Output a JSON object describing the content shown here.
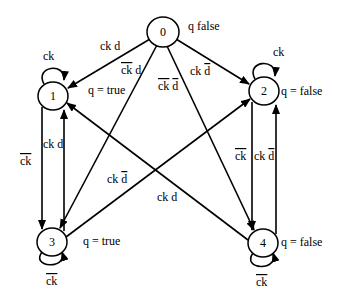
{
  "diagram": {
    "type": "state-machine",
    "nodes": [
      {
        "id": "0",
        "label": "0",
        "output": "q false",
        "cx": 163,
        "cy": 32
      },
      {
        "id": "1",
        "label": "1",
        "output": "q = true",
        "cx": 53,
        "cy": 96
      },
      {
        "id": "2",
        "label": "2",
        "output": "q = false",
        "cx": 264,
        "cy": 91
      },
      {
        "id": "3",
        "label": "3",
        "output": "q = true",
        "cx": 52,
        "cy": 242
      },
      {
        "id": "4",
        "label": "4",
        "output": "q = false",
        "cx": 263,
        "cy": 243
      }
    ],
    "edges": [
      {
        "from": "0",
        "to": "1",
        "label": "ck d"
      },
      {
        "from": "0",
        "to": "3",
        "label": "ck̄ d"
      },
      {
        "from": "0",
        "to": "4",
        "label": "ck̄ d̄"
      },
      {
        "from": "0",
        "to": "2",
        "label": "ck d̄"
      },
      {
        "from": "1",
        "to": "1",
        "label": "ck"
      },
      {
        "from": "1",
        "to": "3",
        "label": "ck̄"
      },
      {
        "from": "3",
        "to": "1",
        "label": "ck d"
      },
      {
        "from": "3",
        "to": "2",
        "label": "ck d̄"
      },
      {
        "from": "4",
        "to": "1",
        "label": "ck d"
      },
      {
        "from": "2",
        "to": "2",
        "label": "ck"
      },
      {
        "from": "2",
        "to": "4",
        "label": "ck̄"
      },
      {
        "from": "4",
        "to": "2",
        "label": "ck d̄"
      },
      {
        "from": "3",
        "to": "3",
        "label": "ck̄"
      },
      {
        "from": "4",
        "to": "4",
        "label": "ck̄"
      }
    ]
  },
  "labels": {
    "n0": "0",
    "n1": "1",
    "n2": "2",
    "n3": "3",
    "n4": "4",
    "out0": "q false",
    "out1": "q = true",
    "out2": "q = false",
    "out3": "q = true",
    "out4": "q = false",
    "ck": "ck",
    "d": "d"
  }
}
